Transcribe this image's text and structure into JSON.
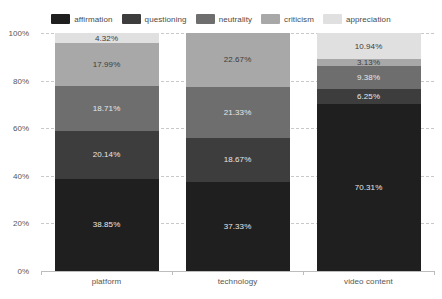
{
  "chart_data": {
    "type": "bar",
    "title": "",
    "subtitle": "",
    "xlabel": "",
    "ylabel": "",
    "stacked": true,
    "orientation": "vertical",
    "grid": true,
    "legend_position": "top",
    "ylim": [
      0,
      100
    ],
    "y_unit": "%",
    "y_ticks": [
      "0%",
      "20%",
      "40%",
      "60%",
      "80%",
      "100%"
    ],
    "y_tick_values": [
      0,
      20,
      40,
      60,
      80,
      100
    ],
    "categories": [
      "platform",
      "technology",
      "video content"
    ],
    "series": [
      {
        "name": "affirmation",
        "color": "#1f1f1f",
        "values": [
          38.85,
          37.33,
          70.31
        ],
        "labels": [
          "38.85%",
          "37.33%",
          "70.31%"
        ]
      },
      {
        "name": "questioning",
        "color": "#3d3d3d",
        "values": [
          20.14,
          18.67,
          6.25
        ],
        "labels": [
          "20.14%",
          "18.67%",
          "6.25%"
        ]
      },
      {
        "name": "neutrality",
        "color": "#6e6e6e",
        "values": [
          18.71,
          21.33,
          9.38
        ],
        "labels": [
          "18.71%",
          "21.33%",
          "9.38%"
        ]
      },
      {
        "name": "criticism",
        "color": "#a8a8a8",
        "values": [
          17.99,
          22.67,
          3.13
        ],
        "labels": [
          "17.99%",
          "22.67%",
          "3.13%"
        ]
      },
      {
        "name": "appreciation",
        "color": "#e0e0e0",
        "values": [
          4.32,
          0,
          10.94
        ],
        "labels": [
          "4.32%",
          "",
          "10.94%"
        ]
      }
    ]
  },
  "legend": {
    "items": [
      {
        "label": "affirmation",
        "color": "#1f1f1f"
      },
      {
        "label": "questioning",
        "color": "#3d3d3d"
      },
      {
        "label": "neutrality",
        "color": "#6e6e6e"
      },
      {
        "label": "criticism",
        "color": "#a8a8a8"
      },
      {
        "label": "appreciation",
        "color": "#e0e0e0"
      }
    ]
  }
}
